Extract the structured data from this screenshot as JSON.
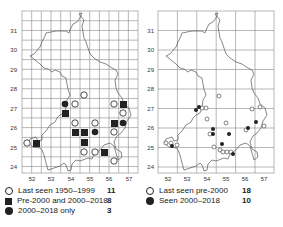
{
  "maps": [
    {
      "name": "left-map",
      "y_ticks": [
        "31",
        "30",
        "29",
        "28",
        "27",
        "26",
        "25",
        "24"
      ],
      "x_ticks": [
        "52",
        "53",
        "54",
        "55",
        "56",
        "57"
      ],
      "legend": [
        {
          "symbol": "open-circle",
          "label": "Last seen 1950–1999",
          "count": "11"
        },
        {
          "symbol": "filled-square",
          "label": "Pre-2000 and 2000–2018",
          "count": "8"
        },
        {
          "symbol": "filled-circle",
          "label": "2000–2018 only",
          "count": "3"
        }
      ]
    },
    {
      "name": "right-map",
      "y_ticks": [
        "31",
        "30",
        "29",
        "28",
        "27",
        "26",
        "25",
        "24"
      ],
      "x_ticks": [
        "52",
        "53",
        "54",
        "55",
        "56",
        "57"
      ],
      "legend": [
        {
          "symbol": "open-circle",
          "label": "Last seen pre-2000",
          "count": "18"
        },
        {
          "symbol": "filled-circle",
          "label": "Seen 2000–2018",
          "count": "10"
        }
      ]
    }
  ]
}
